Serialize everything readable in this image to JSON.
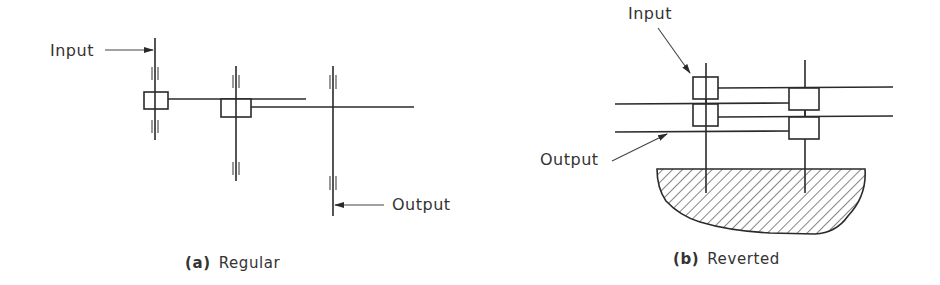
{
  "figure": {
    "regular": {
      "input_label": "Input",
      "output_label": "Output",
      "caption_tag": "(a)",
      "caption_text": "Regular"
    },
    "reverted": {
      "input_label": "Input",
      "output_label": "Output",
      "caption_tag": "(b)",
      "caption_text": "Reverted"
    }
  },
  "colors": {
    "line": "#2a2a2a",
    "text": "#333333",
    "background": "#ffffff"
  }
}
